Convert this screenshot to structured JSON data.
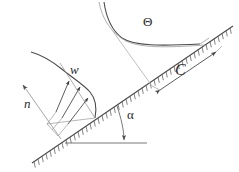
{
  "figure": {
    "type": "technical-line-diagram",
    "background_color": "#ffffff",
    "line_color": "#4a4a4a",
    "label_color": "#2b2b2b",
    "labels": {
      "velocity_profile": "w",
      "normal_direction": "n",
      "wall_coordinate": "C",
      "inclination_angle": "α",
      "temperature_profile": "Θ"
    },
    "elements": [
      {
        "name": "inclined-hatched-wall",
        "description": "Inclined solid boundary drawn as a line with hatch ticks on its lower-right side, rising from lower-left to upper-right"
      },
      {
        "name": "velocity-profile-curve",
        "description": "Boundary-layer velocity profile w rising from the wall, peaking and decaying to zero away from the wall"
      },
      {
        "name": "velocity-profile-arrows",
        "description": "Short arrows from the wall-normal baseline to the velocity curve"
      },
      {
        "name": "temperature-profile-curve",
        "description": "Boundary-layer temperature profile Θ decaying from the wall to the ambient value"
      },
      {
        "name": "normal-direction-arrow",
        "description": "Arrow labelled n pointing away from the wall along its outward normal"
      },
      {
        "name": "wall-coordinate-dimension",
        "description": "Double headed dimension arrow labelled C running parallel to the wall"
      },
      {
        "name": "horizontal-reference-line",
        "description": "Horizontal datum line used to define the inclination angle"
      },
      {
        "name": "angle-arc",
        "description": "Arc between the horizontal datum and the inclined wall, labelled α"
      }
    ],
    "geometry": {
      "wall_start": [
        32,
        163
      ],
      "wall_end": [
        233,
        26
      ],
      "wall_angle_deg": 34,
      "horizontal_line_y": 143,
      "horizontal_line_x_range": [
        65,
        147
      ]
    }
  }
}
